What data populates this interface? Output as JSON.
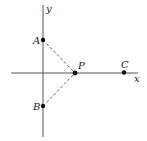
{
  "diagram": {
    "axes": {
      "x_label": "x",
      "y_label": "y",
      "color": "#555555"
    },
    "points": [
      {
        "name": "A",
        "label": "A",
        "position": "on positive y-axis"
      },
      {
        "name": "B",
        "label": "B",
        "position": "on negative y-axis"
      },
      {
        "name": "P",
        "label": "P",
        "position": "on positive x-axis"
      },
      {
        "name": "C",
        "label": "C",
        "position": "on positive x-axis, right of P"
      }
    ],
    "segments": [
      {
        "from": "A",
        "to": "P",
        "style": "dashed"
      },
      {
        "from": "B",
        "to": "P",
        "style": "dashed"
      }
    ],
    "point_color": "#111111"
  }
}
